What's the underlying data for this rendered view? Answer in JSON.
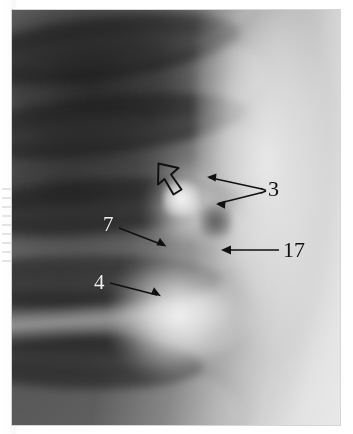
{
  "figure": {
    "kind": "annotated-chest-radiograph",
    "width": 353,
    "height": 434,
    "plate": {
      "left": 12,
      "top": 10,
      "width": 328,
      "height": 415
    },
    "background_color": "#ffffff",
    "ink_color": "#101010",
    "light_label_color": "#f2f2f2"
  },
  "annotations": [
    {
      "id": "open-arrowhead",
      "label": "",
      "label_style": "none",
      "marker": "hollow-arrowhead",
      "points_to": "upper-left",
      "tip": {
        "x": 158,
        "y": 163
      }
    },
    {
      "id": "label-3",
      "label": "3",
      "label_style": "dark",
      "label_pos": {
        "x": 268,
        "y": 178
      },
      "marker": "solid-arrow",
      "arrow_count": 2,
      "arrows": [
        {
          "from": {
            "x": 262,
            "y": 189
          },
          "to": {
            "x": 208,
            "y": 177
          }
        },
        {
          "from": {
            "x": 262,
            "y": 193
          },
          "to": {
            "x": 217,
            "y": 204
          }
        }
      ]
    },
    {
      "id": "label-7",
      "label": "7",
      "label_style": "light",
      "label_pos": {
        "x": 103,
        "y": 214
      },
      "marker": "solid-arrow",
      "arrow_count": 1,
      "arrows": [
        {
          "from": {
            "x": 119,
            "y": 228
          },
          "to": {
            "x": 166,
            "y": 246
          }
        }
      ]
    },
    {
      "id": "label-17",
      "label": "17",
      "label_style": "dark",
      "label_pos": {
        "x": 283,
        "y": 239
      },
      "marker": "solid-arrow",
      "arrow_count": 1,
      "arrows": [
        {
          "from": {
            "x": 279,
            "y": 250
          },
          "to": {
            "x": 221,
            "y": 250
          }
        }
      ]
    },
    {
      "id": "label-4",
      "label": "4",
      "label_style": "light",
      "label_pos": {
        "x": 94,
        "y": 272
      },
      "marker": "solid-arrow",
      "arrow_count": 1,
      "arrows": [
        {
          "from": {
            "x": 110,
            "y": 283
          },
          "to": {
            "x": 160,
            "y": 296
          }
        }
      ]
    }
  ]
}
